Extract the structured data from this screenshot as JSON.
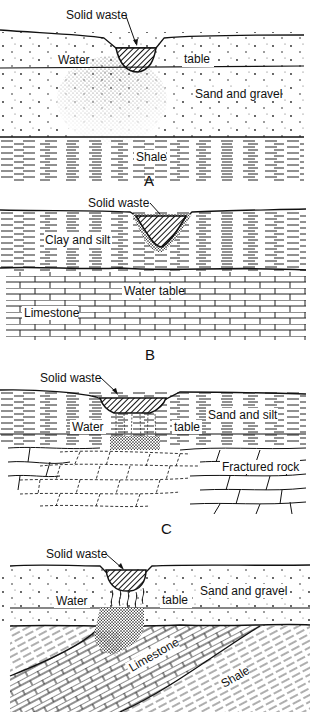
{
  "figure": {
    "panels": [
      {
        "id": "A",
        "letter": "A",
        "labels": {
          "waste": "Solid waste",
          "water": "Water",
          "table": "table",
          "layer1": "Sand and gravel",
          "layer2": "Shale"
        }
      },
      {
        "id": "B",
        "letter": "B",
        "labels": {
          "waste": "Solid waste",
          "layer1": "Clay and silt",
          "water_table": "Water table",
          "layer2": "Limestone"
        }
      },
      {
        "id": "C",
        "letter": "C",
        "labels": {
          "waste": "Solid waste",
          "layer1": "Sand and silt",
          "water": "Water",
          "table": "table",
          "layer2": "Fractured rock"
        }
      },
      {
        "id": "D",
        "labels": {
          "waste": "Solid waste",
          "layer1": "Sand and gravel",
          "water": "Water",
          "table": "table",
          "layer2": "Limestone",
          "layer3": "Shale"
        }
      }
    ]
  }
}
